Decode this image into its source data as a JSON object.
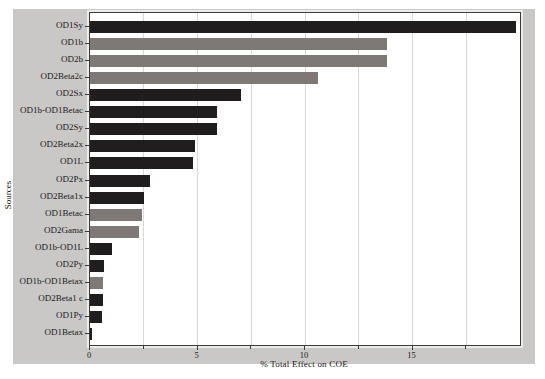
{
  "figure": {
    "page_background": "#ffffff",
    "figure_background": "#c9c8c6",
    "plot_background": "#ffffff",
    "border_color": "#3b3b3b",
    "gridline_color": "#d8d8d8",
    "text_color": "#1a1a1a"
  },
  "chart_data": {
    "type": "bar",
    "orientation": "horizontal",
    "title": "",
    "xlabel": "% Total Effect on COE",
    "ylabel": "Sources",
    "xlim": [
      0,
      20
    ],
    "x_major_ticks": [
      0,
      5,
      10,
      15
    ],
    "x_minor_ticks": [
      2.5,
      7.5,
      12.5,
      17.5
    ],
    "gridlines_x": [
      2.5,
      5,
      7.5,
      10,
      12.5,
      15,
      17.5
    ],
    "grid": "on",
    "legend": "none",
    "categories": [
      "OD1Sy",
      "OD1b",
      "OD2b",
      "OD2Beta2c",
      "OD2Sx",
      "OD1b-OD1Betac",
      "OD2Sy",
      "OD2Beta2x",
      "OD1L",
      "OD2Px",
      "OD2Beta1x",
      "OD1Betac",
      "OD2Gama",
      "OD1b-OD1L",
      "OD2Py",
      "OD1b-OD1Betax",
      "OD2Beta1 c",
      "OD1Py",
      "OD1Betax"
    ],
    "values": [
      19.8,
      13.8,
      13.8,
      10.6,
      7.0,
      5.9,
      5.9,
      4.9,
      4.8,
      2.8,
      2.5,
      2.4,
      2.3,
      1.0,
      0.65,
      0.6,
      0.6,
      0.55,
      0.07
    ],
    "bar_color_keys": [
      "dark",
      "gray",
      "gray",
      "gray",
      "dark",
      "dark",
      "dark",
      "dark",
      "dark",
      "dark",
      "dark",
      "gray",
      "gray",
      "dark",
      "dark",
      "gray",
      "dark",
      "dark",
      "dark"
    ],
    "bar_colors": {
      "dark": "#1f1d1d",
      "gray": "#7e7977"
    }
  }
}
